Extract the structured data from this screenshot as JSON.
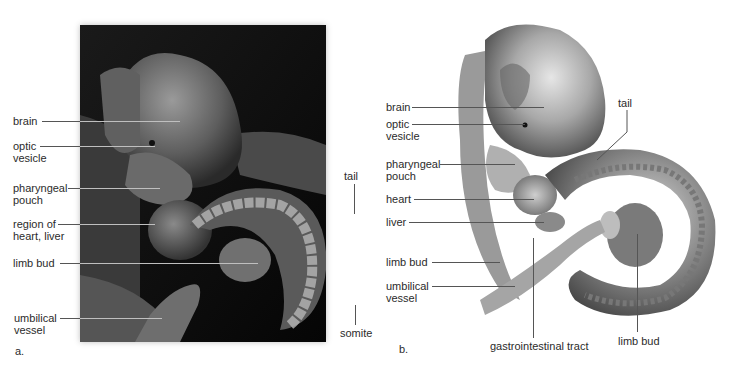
{
  "figure": {
    "panel_a": {
      "letter": "a.",
      "description": "Scanning electron micrograph of embryo (grayscale)",
      "labels": [
        {
          "id": "brain",
          "text": "brain"
        },
        {
          "id": "optic-vesicle",
          "text": "optic\nvesicle"
        },
        {
          "id": "pharyngeal-pouch",
          "text": "pharyngeal\npouch"
        },
        {
          "id": "region-heart-liver",
          "text": "region of\nheart, liver"
        },
        {
          "id": "limb-bud",
          "text": "limb bud"
        },
        {
          "id": "umbilical-vessel",
          "text": "umbilical\nvessel"
        },
        {
          "id": "tail",
          "text": "tail"
        },
        {
          "id": "somite",
          "text": "somite"
        }
      ]
    },
    "panel_b": {
      "letter": "b.",
      "description": "Illustrated drawing of embryo (grayscale)",
      "labels": [
        {
          "id": "brain",
          "text": "brain"
        },
        {
          "id": "optic-vesicle",
          "text": "optic\nvesicle"
        },
        {
          "id": "pharyngeal-pouch",
          "text": "pharyngeal\npouch"
        },
        {
          "id": "heart",
          "text": "heart"
        },
        {
          "id": "liver",
          "text": "liver"
        },
        {
          "id": "limb-bud-left",
          "text": "limb bud"
        },
        {
          "id": "umbilical-vessel",
          "text": "umbilical\nvessel"
        },
        {
          "id": "tail",
          "text": "tail"
        },
        {
          "id": "gastrointestinal-tract",
          "text": "gastrointestinal tract"
        },
        {
          "id": "limb-bud-bottom",
          "text": "limb bud"
        }
      ]
    }
  }
}
